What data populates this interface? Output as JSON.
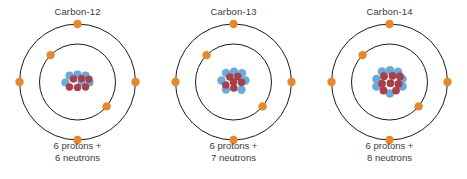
{
  "figure": {
    "background_color": "#ffffff",
    "orbit_stroke_color": "#1a1a1a",
    "electron_color": "#e8882a",
    "neutron_color": "#6aa9dc",
    "proton_color": "#a8404a",
    "text_color": "#3b3b3b"
  },
  "atoms": [
    {
      "title": "Carbon-12",
      "caption_line1": "6 protons +",
      "caption_line2": "6 neutrons",
      "protons": 6,
      "neutrons": 6,
      "mass_number": 12,
      "electrons_inner": 2,
      "electrons_outer": 4,
      "nucleus_size": "small"
    },
    {
      "title": "Carbon-13",
      "caption_line1": "6 protons +",
      "caption_line2": "7 neutrons",
      "protons": 6,
      "neutrons": 7,
      "mass_number": 13,
      "electrons_inner": 2,
      "electrons_outer": 4,
      "nucleus_size": "medium"
    },
    {
      "title": "Carbon-14",
      "caption_line1": "6 protons +",
      "caption_line2": "8 neutrons",
      "protons": 6,
      "neutrons": 8,
      "mass_number": 14,
      "electrons_inner": 2,
      "electrons_outer": 4,
      "nucleus_size": "large"
    }
  ],
  "geometry": {
    "center_x": 77.5,
    "center_y": 82,
    "outer_radius": 58,
    "inner_radius": 38,
    "electron_radius": 4.2,
    "outer_electron_angles_deg": [
      -90,
      180,
      0,
      90
    ],
    "inner_electron_angles_deg": [
      -225,
      -40
    ]
  }
}
